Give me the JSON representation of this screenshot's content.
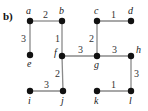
{
  "title": "b)",
  "nodes": [
    {
      "id": "a",
      "x": 30,
      "y": 21,
      "lx": 26,
      "ly": 14
    },
    {
      "id": "b",
      "x": 62,
      "y": 21,
      "lx": 59,
      "ly": 14
    },
    {
      "id": "c",
      "x": 97,
      "y": 21,
      "lx": 94,
      "ly": 14
    },
    {
      "id": "d",
      "x": 131,
      "y": 21,
      "lx": 128,
      "ly": 14
    },
    {
      "id": "e",
      "x": 30,
      "y": 55,
      "lx": 27,
      "ly": 67
    },
    {
      "id": "f",
      "x": 62,
      "y": 56,
      "lx": 54,
      "ly": 56
    },
    {
      "id": "g",
      "x": 97,
      "y": 56,
      "lx": 94,
      "ly": 68
    },
    {
      "id": "h",
      "x": 131,
      "y": 56,
      "lx": 136,
      "ly": 53
    },
    {
      "id": "i",
      "x": 30,
      "y": 91,
      "lx": 28,
      "ly": 104
    },
    {
      "id": "j",
      "x": 63,
      "y": 91,
      "lx": 61,
      "ly": 104
    },
    {
      "id": "k",
      "x": 97,
      "y": 91,
      "lx": 94,
      "ly": 104
    },
    {
      "id": "l",
      "x": 131,
      "y": 91,
      "lx": 129,
      "ly": 104
    }
  ],
  "edges": [
    {
      "from": "a",
      "to": "b",
      "weight": "2",
      "wx": 43,
      "wy": 18
    },
    {
      "from": "a",
      "to": "e",
      "weight": "3",
      "wx": 21,
      "wy": 42
    },
    {
      "from": "b",
      "to": "f",
      "weight": "1",
      "wx": 55,
      "wy": 42
    },
    {
      "from": "c",
      "to": "d",
      "weight": "1",
      "wx": 111,
      "wy": 18
    },
    {
      "from": "c",
      "to": "g",
      "weight": "2",
      "wx": 89,
      "wy": 42
    },
    {
      "from": "f",
      "to": "g",
      "weight": "3",
      "wx": 78,
      "wy": 53
    },
    {
      "from": "g",
      "to": "h",
      "weight": "3",
      "wx": 112,
      "wy": 53
    },
    {
      "from": "f",
      "to": "j",
      "weight": "2",
      "wx": 55,
      "wy": 77
    },
    {
      "from": "h",
      "to": "l",
      "weight": "3",
      "wx": 134,
      "wy": 77
    },
    {
      "from": "i",
      "to": "j",
      "weight": "3",
      "wx": 44,
      "wy": 88
    },
    {
      "from": "k",
      "to": "l",
      "weight": "1",
      "wx": 111,
      "wy": 88
    }
  ]
}
